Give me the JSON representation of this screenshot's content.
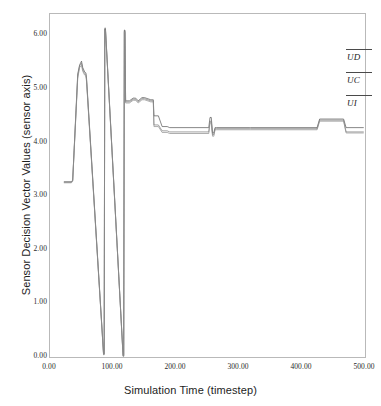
{
  "title": {
    "text": "",
    "truncated": true
  },
  "axes": {
    "xlabel": "Simulation Time (timestep)",
    "ylabel": "Sensor Decision Vector Values (sensor axis)",
    "xticks": [
      "0.00",
      "100.00",
      "200.00",
      "300.00",
      "400.00",
      "500.00"
    ],
    "yticks": [
      "0.00",
      "1.00",
      "2.00",
      "3.00",
      "4.00",
      "5.00",
      "6.00"
    ]
  },
  "legend": {
    "position": "top-right",
    "entries": [
      {
        "label": "UD",
        "color": "#4a4a4a"
      },
      {
        "label": "UC",
        "color": "#4a4a4a"
      },
      {
        "label": "UI",
        "color": "#4a4a4a"
      }
    ]
  },
  "chart_data": {
    "type": "line",
    "title": "",
    "xlabel": "Simulation Time (timestep)",
    "ylabel": "Sensor Decision Vector Values (sensor axis)",
    "xlim": [
      0,
      500
    ],
    "ylim": [
      0,
      6.4
    ],
    "xticks": [
      0,
      100,
      200,
      300,
      400,
      500
    ],
    "yticks": [
      0,
      1,
      2,
      3,
      4,
      5,
      6
    ],
    "grid": false,
    "legend_position": "top-right",
    "series": [
      {
        "name": "UD",
        "color": "#555555",
        "x": [
          22,
          34,
          36,
          44,
          47,
          50,
          52,
          55,
          57,
          58,
          85,
          86,
          87,
          88,
          116,
          117,
          118,
          119,
          120,
          126,
          132,
          136,
          140,
          146,
          150,
          160,
          164,
          165,
          172,
          178,
          186,
          190,
          252,
          254,
          256,
          258,
          260,
          262,
          264,
          316,
          318,
          424,
          428,
          466,
          470,
          498
        ],
        "y": [
          3.27,
          3.27,
          3.3,
          5.28,
          5.45,
          5.52,
          5.4,
          5.32,
          5.3,
          5.2,
          0.06,
          0.06,
          6.12,
          6.12,
          0.02,
          0.02,
          6.1,
          6.1,
          4.78,
          4.78,
          4.83,
          4.83,
          4.78,
          4.84,
          4.84,
          4.8,
          4.8,
          4.5,
          4.5,
          4.3,
          4.3,
          4.28,
          4.28,
          4.47,
          4.47,
          4.18,
          4.18,
          4.28,
          4.28,
          4.28,
          4.28,
          4.28,
          4.44,
          4.44,
          4.28,
          4.28
        ]
      },
      {
        "name": "UC",
        "color": "#7a7a7a",
        "x": [
          22,
          34,
          36,
          44,
          47,
          50,
          52,
          55,
          57,
          58,
          85,
          86,
          87,
          88,
          116,
          117,
          118,
          119,
          120,
          126,
          132,
          136,
          140,
          146,
          150,
          160,
          164,
          165,
          172,
          178,
          186,
          190,
          252,
          254,
          256,
          258,
          260,
          262,
          264,
          316,
          318,
          424,
          428,
          466,
          470,
          498
        ],
        "y": [
          3.26,
          3.26,
          3.29,
          5.24,
          5.43,
          5.48,
          5.36,
          5.29,
          5.27,
          5.17,
          0.05,
          0.05,
          6.14,
          6.14,
          0.03,
          0.03,
          6.08,
          6.08,
          4.76,
          4.76,
          4.81,
          4.81,
          4.76,
          4.82,
          4.82,
          4.78,
          4.78,
          4.33,
          4.33,
          4.22,
          4.22,
          4.2,
          4.2,
          4.4,
          4.4,
          4.15,
          4.15,
          4.26,
          4.26,
          4.26,
          4.26,
          4.26,
          4.42,
          4.42,
          4.2,
          4.2
        ]
      },
      {
        "name": "UI",
        "color": "#8c8c8c",
        "x": [
          22,
          34,
          36,
          44,
          47,
          50,
          52,
          55,
          57,
          58,
          85,
          86,
          87,
          88,
          116,
          117,
          118,
          119,
          120,
          126,
          132,
          136,
          140,
          146,
          150,
          160,
          164,
          165,
          172,
          178,
          186,
          190,
          252,
          254,
          256,
          258,
          260,
          262,
          264,
          316,
          318,
          424,
          428,
          466,
          470,
          498
        ],
        "y": [
          3.25,
          3.25,
          3.28,
          5.2,
          5.4,
          5.44,
          5.33,
          5.26,
          5.24,
          5.14,
          0.04,
          0.04,
          6.1,
          6.1,
          0.01,
          0.01,
          6.06,
          6.06,
          4.74,
          4.74,
          4.79,
          4.79,
          4.74,
          4.8,
          4.8,
          4.76,
          4.76,
          4.3,
          4.3,
          4.19,
          4.19,
          4.17,
          4.17,
          4.37,
          4.37,
          4.12,
          4.12,
          4.24,
          4.24,
          4.24,
          4.24,
          4.24,
          4.4,
          4.4,
          4.18,
          4.18
        ]
      }
    ]
  }
}
